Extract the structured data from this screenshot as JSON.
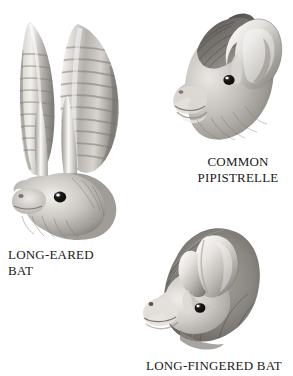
{
  "plate": {
    "background_color": "#ffffff",
    "width": 293,
    "height": 376,
    "palette": {
      "ink": "#1a1a1a",
      "fur_light": "#e8e6e3",
      "fur_mid": "#b9b5b0",
      "fur_dark": "#6e6a66",
      "fur_darkest": "#3d3a37",
      "ear_pale": "#efedea",
      "ear_shadow": "#9a9793",
      "eye": "#111111",
      "eye_highlight": "#ffffff"
    }
  },
  "figures": [
    {
      "id": "long-eared-bat",
      "caption": "LONG-EARED\nBAT",
      "caption_lines": [
        "LONG-EARED",
        "BAT"
      ],
      "subject": "bat head in profile with two very long ribbed ears and two slender tragus spikes",
      "caption_align": "left"
    },
    {
      "id": "common-pipistrelle",
      "caption": "COMMON\nPIPISTRELLE",
      "caption_lines": [
        "COMMON",
        "PIPISTRELLE"
      ],
      "subject": "bat head in profile with short rounded pale ear and dark far ear, dark crown fur",
      "caption_align": "center"
    },
    {
      "id": "long-fingered-bat",
      "caption": "LONG-FINGERED BAT",
      "caption_lines": [
        "LONG-FINGERED BAT"
      ],
      "subject": "bat head in profile with broad spade-shaped pale ear and shaggy dark fur",
      "caption_align": "left"
    }
  ]
}
